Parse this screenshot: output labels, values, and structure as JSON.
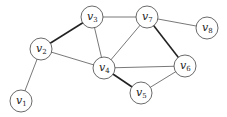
{
  "graph": {
    "nodes": [
      {
        "id": "v1",
        "label": "v",
        "sub": "1",
        "x": 21,
        "y": 101
      },
      {
        "id": "v2",
        "label": "v",
        "sub": "2",
        "x": 41,
        "y": 49
      },
      {
        "id": "v3",
        "label": "v",
        "sub": "3",
        "x": 92,
        "y": 17
      },
      {
        "id": "v4",
        "label": "v",
        "sub": "4",
        "x": 104,
        "y": 68
      },
      {
        "id": "v5",
        "label": "v",
        "sub": "5",
        "x": 141,
        "y": 93
      },
      {
        "id": "v6",
        "label": "v",
        "sub": "6",
        "x": 185,
        "y": 66
      },
      {
        "id": "v7",
        "label": "v",
        "sub": "7",
        "x": 147,
        "y": 17
      },
      {
        "id": "v8",
        "label": "v",
        "sub": "8",
        "x": 207,
        "y": 28
      }
    ],
    "edges": [
      {
        "from": "v1",
        "to": "v2",
        "bold": false
      },
      {
        "from": "v2",
        "to": "v3",
        "bold": true
      },
      {
        "from": "v2",
        "to": "v4",
        "bold": false
      },
      {
        "from": "v3",
        "to": "v4",
        "bold": false
      },
      {
        "from": "v3",
        "to": "v7",
        "bold": false
      },
      {
        "from": "v4",
        "to": "v7",
        "bold": false
      },
      {
        "from": "v4",
        "to": "v6",
        "bold": false
      },
      {
        "from": "v4",
        "to": "v5",
        "bold": true
      },
      {
        "from": "v5",
        "to": "v6",
        "bold": false
      },
      {
        "from": "v7",
        "to": "v6",
        "bold": true
      },
      {
        "from": "v7",
        "to": "v8",
        "bold": false
      }
    ],
    "node_radius": 11
  }
}
